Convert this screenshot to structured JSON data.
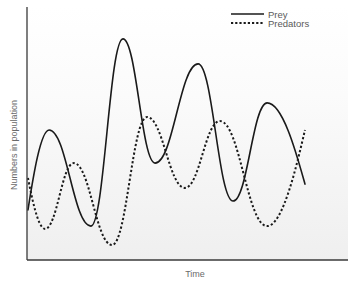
{
  "chart_data": {
    "type": "line",
    "title": "",
    "xlabel": "Time",
    "ylabel": "Numbers in population",
    "xlim": [
      0,
      100
    ],
    "ylim": [
      0,
      100
    ],
    "grid": false,
    "ticks": false,
    "legend_position": "top-right",
    "series": [
      {
        "name": "Prey",
        "style": "solid",
        "color": "#1a1a1a",
        "points": [
          {
            "x": 0.3,
            "y": 19.8
          },
          {
            "x": 6.9,
            "y": 51.4
          },
          {
            "x": 19.9,
            "y": 13.4
          },
          {
            "x": 29.9,
            "y": 87.4
          },
          {
            "x": 39.9,
            "y": 38.3
          },
          {
            "x": 53.3,
            "y": 77.5
          },
          {
            "x": 64.2,
            "y": 23.3
          },
          {
            "x": 74.8,
            "y": 62.1
          },
          {
            "x": 86.6,
            "y": 30.0
          }
        ]
      },
      {
        "name": "Predators",
        "style": "dashed",
        "color": "#1a1a1a",
        "points": [
          {
            "x": 0.3,
            "y": 32.4
          },
          {
            "x": 5.6,
            "y": 12.3
          },
          {
            "x": 14.6,
            "y": 38.3
          },
          {
            "x": 26.5,
            "y": 5.9
          },
          {
            "x": 37.4,
            "y": 56.5
          },
          {
            "x": 49.2,
            "y": 28.5
          },
          {
            "x": 60.1,
            "y": 54.9
          },
          {
            "x": 74.8,
            "y": 13.4
          },
          {
            "x": 86.6,
            "y": 51.4
          }
        ]
      }
    ]
  },
  "colors": {
    "axis": "#3a3a3a",
    "background_top": "#ffffff",
    "background_bottom": "#efefef"
  }
}
